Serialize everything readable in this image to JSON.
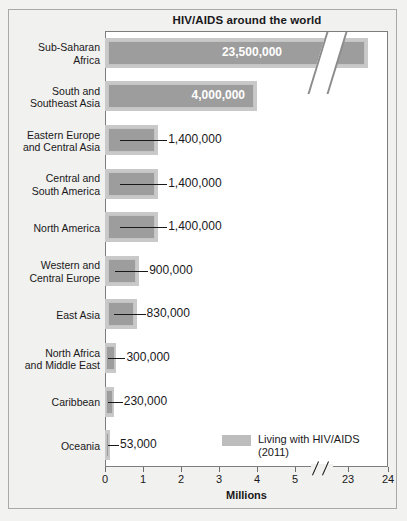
{
  "chart_data": {
    "type": "bar",
    "orientation": "horizontal",
    "title": "HIV/AIDS around the world",
    "xlabel": "Millions",
    "ylabel": "",
    "categories": [
      "Sub-Saharan\nAfrica",
      "South and\nSoutheast Asia",
      "Eastern Europe\nand Central Asia",
      "Central and\nSouth America",
      "North America",
      "Western and\nCentral Europe",
      "East Asia",
      "North Africa\nand Middle East",
      "Caribbean",
      "Oceania"
    ],
    "values": [
      23500000,
      4000000,
      1400000,
      1400000,
      1400000,
      900000,
      830000,
      300000,
      230000,
      53000
    ],
    "value_labels": [
      "23,500,000",
      "4,000,000",
      "1,400,000",
      "1,400,000",
      "1,400,000",
      "900,000",
      "830,000",
      "300,000",
      "230,000",
      "53,000"
    ],
    "label_inside": [
      true,
      true,
      false,
      false,
      false,
      false,
      false,
      false,
      false,
      false
    ],
    "xticks": [
      0,
      1,
      2,
      3,
      4,
      5,
      23,
      24
    ],
    "xtick_labels": [
      "0",
      "1",
      "2",
      "3",
      "4",
      "5",
      "23",
      "24"
    ],
    "xlim": [
      0,
      24
    ],
    "axis_break": true,
    "axis_break_between": [
      5,
      23
    ],
    "grid": false,
    "legend": {
      "position": "inside-bottom-right",
      "entries": [
        {
          "label": "Living with HIV/AIDS\n(2011)",
          "color": "#bdbdbd"
        }
      ]
    },
    "colors": {
      "bar_fill": "#9d9d9d",
      "bar_shadow": "#c9c9c9",
      "bar_highlight": "#c4c4c4",
      "plot_background": "#ffffff",
      "figure_background": "#f1f1ef",
      "frame": "#7d7d7d",
      "text": "#19181a",
      "inside_label_text": "#ffffff"
    }
  },
  "figure": {
    "title": "HIV/AIDS around the world",
    "axis_title": "Millions",
    "legend_label": "Living with HIV/AIDS\n(2011)"
  }
}
